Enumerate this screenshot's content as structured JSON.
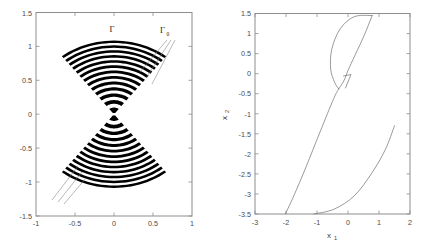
{
  "figure": {
    "background_color": "#ffffff",
    "panel_count": 2
  },
  "chart_data": [
    {
      "type": "line",
      "panel": "left",
      "title": "",
      "xlabel": "",
      "ylabel": "",
      "xlim": [
        -1,
        1
      ],
      "ylim": [
        -1.5,
        1.5
      ],
      "xticks": [
        -1,
        -0.5,
        0,
        0.5,
        1
      ],
      "xticklabels": [
        "-1",
        "-0.5",
        "0",
        "0.5",
        "1"
      ],
      "yticks": [
        -1.5,
        -1,
        -0.5,
        0,
        0.5,
        1,
        1.5
      ],
      "yticklabels": [
        "-1.5",
        "-1",
        "-0.5",
        "0",
        "0.5",
        "1",
        "1.5"
      ],
      "grid": false,
      "legend": null,
      "annotations": [
        {
          "text": "Γ",
          "x": -0.02,
          "y": 1.22,
          "name": "gamma-label"
        },
        {
          "text": "Γ",
          "sub": "0",
          "x": 0.52,
          "y": 1.24,
          "name": "gamma-zero-label"
        }
      ],
      "description": "Bowtie / double-cone of alternating black arc bands converging to the origin; thin leader lines point from the labels into the band family.",
      "series": [
        {
          "name": "upper-cone-bands",
          "apex": [
            0.0,
            0.0
          ],
          "half_angle_deg": 38,
          "radius_range": [
            0.02,
            1.12
          ],
          "band_count": 13
        },
        {
          "name": "lower-cone-bands",
          "apex": [
            0.0,
            0.0
          ],
          "half_angle_deg": 38,
          "radius_range": [
            0.02,
            1.12
          ],
          "band_count": 13
        }
      ]
    },
    {
      "type": "line",
      "panel": "right",
      "title": "",
      "xlabel": "x",
      "xlabel_sub": "1",
      "ylabel": "x",
      "ylabel_sub": "2",
      "xlim": [
        -3,
        2
      ],
      "ylim": [
        -3.5,
        1.5
      ],
      "xticks": [
        -3,
        -2,
        -1,
        0,
        1,
        2
      ],
      "xticklabels": [
        "-3",
        "-2",
        "-1",
        "0",
        "1",
        "2"
      ],
      "yticks": [
        -3.5,
        -3,
        -2.5,
        -2,
        -1.5,
        -1,
        -0.5,
        0,
        0.5,
        1,
        1.5
      ],
      "yticklabels": [
        "-3.5",
        "-3",
        "-2.5",
        "-2",
        "-1.5",
        "-1",
        "-0.5",
        "0",
        "0.5",
        "1",
        "1.5"
      ],
      "grid": false,
      "legend": null,
      "annotations": [
        {
          "text": "hook-marker",
          "x": 0.05,
          "y": 0.1,
          "name": "hook-marker"
        }
      ],
      "description": "Teardrop/leaf-shaped closed loop in the upper region joined to a long nearly-straight branch descending to the lower-left, plus a separate concave branch rising to the lower-right.",
      "series": [
        {
          "name": "leaf-loop-left-arc",
          "points": [
            [
              0.78,
              1.45
            ],
            [
              0.2,
              1.42
            ],
            [
              -0.25,
              1.12
            ],
            [
              -0.52,
              0.62
            ],
            [
              -0.56,
              0.12
            ],
            [
              -0.43,
              -0.22
            ],
            [
              -0.3,
              -0.38
            ]
          ]
        },
        {
          "name": "leaf-loop-right-arc",
          "points": [
            [
              0.78,
              1.45
            ],
            [
              0.52,
              0.95
            ],
            [
              0.22,
              0.45
            ],
            [
              0.0,
              0.08
            ],
            [
              -0.12,
              -0.16
            ],
            [
              -0.3,
              -0.38
            ]
          ]
        },
        {
          "name": "long-descending-branch",
          "points": [
            [
              -0.3,
              -0.38
            ],
            [
              -0.46,
              -0.62
            ],
            [
              -0.9,
              -1.45
            ],
            [
              -1.35,
              -2.32
            ],
            [
              -1.75,
              -3.05
            ],
            [
              -2.02,
              -3.5
            ]
          ]
        },
        {
          "name": "lower-right-branch",
          "points": [
            [
              -1.1,
              -3.5
            ],
            [
              -0.45,
              -3.38
            ],
            [
              0.2,
              -3.05
            ],
            [
              0.75,
              -2.5
            ],
            [
              1.2,
              -1.9
            ],
            [
              1.5,
              -1.3
            ]
          ]
        }
      ]
    }
  ]
}
